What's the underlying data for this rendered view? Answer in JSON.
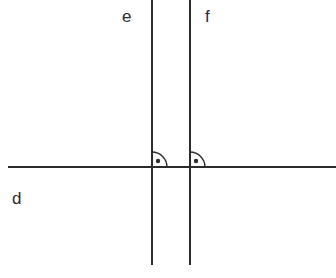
{
  "canvas": {
    "width": 336,
    "height": 278,
    "background_color": "#ffffff",
    "stroke_color": "#2b2b2b",
    "stroke_width": 2
  },
  "figure": {
    "type": "geometry-diagram"
  },
  "labels": {
    "d": "d",
    "e": "e",
    "f": "f"
  },
  "lines": [
    {
      "id": "d",
      "label": "d",
      "orientation": "horizontal",
      "x1": 8,
      "y1": 167,
      "x2": 336,
      "y2": 167,
      "label_x": 12,
      "label_y": 190
    },
    {
      "id": "e",
      "label": "e",
      "orientation": "vertical",
      "x1": 152,
      "y1": 0,
      "x2": 152,
      "y2": 265,
      "label_x": 122,
      "label_y": 8
    },
    {
      "id": "f",
      "label": "f",
      "orientation": "vertical",
      "x1": 190,
      "y1": 0,
      "x2": 190,
      "y2": 265,
      "label_x": 205,
      "label_y": 8
    }
  ],
  "right_angle_marks": [
    {
      "id": "angle-d-e",
      "at_x": 152,
      "at_y": 167,
      "radius": 15,
      "quadrant": "upper-right",
      "dot_x": 158,
      "dot_y": 161,
      "dot_radius": 2.2,
      "measure": "90"
    },
    {
      "id": "angle-d-f",
      "at_x": 190,
      "at_y": 167,
      "radius": 15,
      "quadrant": "upper-right",
      "dot_x": 196,
      "dot_y": 161,
      "dot_radius": 2.2,
      "measure": "90"
    }
  ]
}
